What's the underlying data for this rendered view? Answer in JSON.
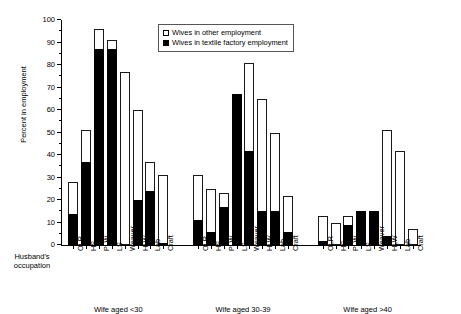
{
  "chart_data": {
    "type": "bar",
    "subtype": "stacked-grouped",
    "title": "",
    "xlabel": "Husband's occupation",
    "ylabel": "Percent in employment",
    "ylim": [
      0,
      100
    ],
    "ytick_step": 10,
    "yticks": [
      0,
      10,
      20,
      30,
      40,
      50,
      60,
      70,
      80,
      90,
      100
    ],
    "grid": false,
    "legend_position": "top-center",
    "categories": [
      "OLR",
      "HS",
      "PLW",
      "LS",
      "Weaver",
      "HLW",
      "Lab",
      "Craft"
    ],
    "series": [
      {
        "name": "Wives in textile factory employment",
        "color": "#000000",
        "groups": [
          {
            "group": "Wife aged <30",
            "values": [
              14,
              37,
              87,
              87,
              0,
              20,
              24,
              1
            ]
          },
          {
            "group": "Wife aged 30-39",
            "values": [
              11,
              6,
              17,
              67,
              42,
              15,
              15,
              6
            ]
          },
          {
            "group": "Wife aged >40",
            "values": [
              2,
              0,
              9,
              15,
              15,
              4,
              0,
              0
            ]
          }
        ]
      },
      {
        "name": "Wives in other employment",
        "color": "#ffffff",
        "groups": [
          {
            "group": "Wife aged <30",
            "values": [
              28,
              51,
              96,
              91,
              77,
              60,
              37,
              31
            ]
          },
          {
            "group": "Wife aged 30-39",
            "values": [
              31,
              25,
              23,
              67,
              81,
              65,
              50,
              22
            ]
          },
          {
            "group": "Wife aged >40",
            "values": [
              13,
              10,
              13,
              15,
              15,
              51,
              42,
              7
            ]
          }
        ]
      }
    ],
    "groups": [
      "Wife aged <30",
      "Wife aged 30-39",
      "Wife aged >40"
    ]
  },
  "legend": {
    "items": [
      {
        "label": "Wives in other employment",
        "swatch": "open-square"
      },
      {
        "label": "Wives in textile factory employment",
        "swatch": "filled-square"
      }
    ]
  },
  "axes": {
    "y_title": "Percent in employment",
    "x_caption_line1": "Husband's",
    "x_caption_line2": "occupation"
  }
}
